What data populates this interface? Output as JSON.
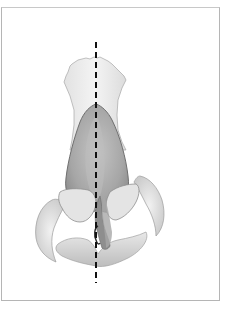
{
  "figure": {
    "elements": [
      "nasal-bone-region",
      "upper-lateral-cartilage",
      "septal-cartilage",
      "lower-lateral-cartilages",
      "alar-rims",
      "columella",
      "midline-dashed-line"
    ],
    "colors": {
      "border": "#b5b5b5",
      "cartilage_dark": "#9a9a9a",
      "cartilage_mid": "#b8b8b8",
      "soft_tissue": "#e6e6e6",
      "outline": "#8c8c8c",
      "midline": "#111111"
    }
  }
}
